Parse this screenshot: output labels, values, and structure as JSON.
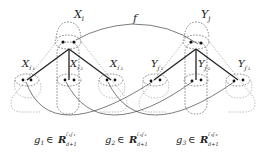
{
  "diagram": {
    "left_root": {
      "label": "X",
      "sub": "i"
    },
    "right_root": {
      "label": "Y",
      "sub": "j"
    },
    "left_children": [
      {
        "label": "X",
        "sub": "i′₁"
      },
      {
        "label": "X",
        "sub": "i′₂"
      },
      {
        "label": "X",
        "sub": "i′₃"
      }
    ],
    "right_children": [
      {
        "label": "Y",
        "sub": "j′₁"
      },
      {
        "label": "Y",
        "sub": "j′₂"
      },
      {
        "label": "Y",
        "sub": "j′₃"
      }
    ],
    "mapping_label": "f",
    "bottom_labels": [
      {
        "g": "g",
        "g_sub": "1",
        "in": "∈",
        "R": "R",
        "R_sup": "i′₁j′₁",
        "R_sub": "d+1"
      },
      {
        "g": "g",
        "g_sub": "2",
        "in": "∈",
        "R": "R",
        "R_sup": "i′₂j′₂",
        "R_sub": "d+1"
      },
      {
        "g": "g",
        "g_sub": "3",
        "in": "∈",
        "R": "R",
        "R_sup": "i′₃j′₃",
        "R_sub": "d+1"
      }
    ]
  }
}
